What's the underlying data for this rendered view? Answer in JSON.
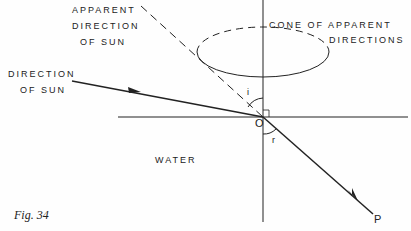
{
  "labels": {
    "apparent_direction": [
      "APPARENT",
      "DIRECTION",
      "OF SUN"
    ],
    "direction_of_sun": [
      "DIRECTION",
      "OF SUN"
    ],
    "cone": [
      "CONE OF APPARENT",
      "DIRECTIONS"
    ],
    "water": "WATER",
    "origin": "O",
    "angle_incidence": "i",
    "angle_refraction": "r",
    "point_p": "P",
    "figure_caption": "Fig. 34"
  },
  "colors": {
    "ink": "#222222",
    "background": "#fefefe"
  }
}
